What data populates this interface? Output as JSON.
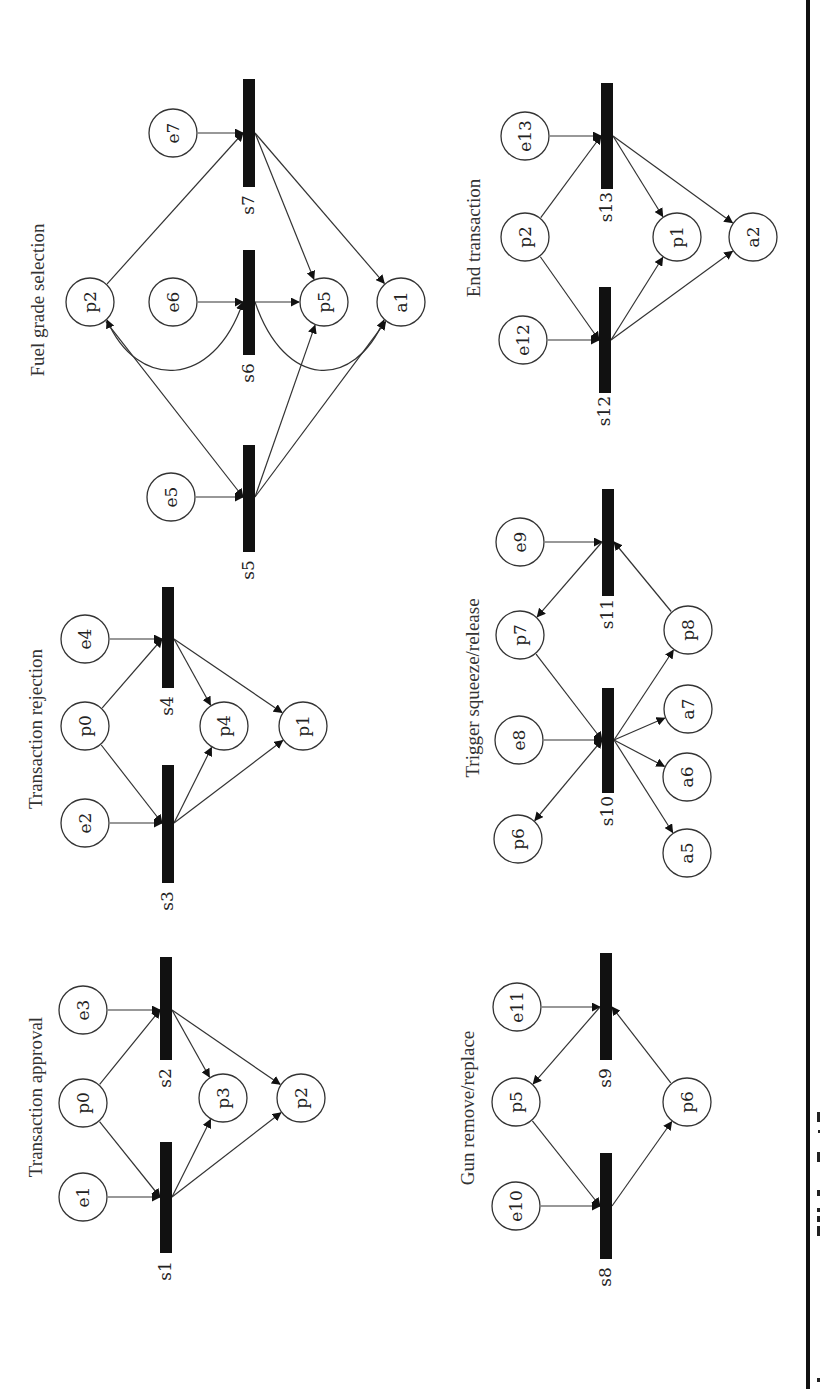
{
  "figure": {
    "orientation": "rotated 90deg (text reads bottom-to-top)",
    "panels": [
      {
        "id": "transaction-approval",
        "title": "Transaction approval",
        "title_pos": [
          38,
          1097
        ],
        "places": [
          {
            "id": "e1",
            "x": 83,
            "y": 1197
          },
          {
            "id": "p0",
            "x": 83,
            "y": 1103
          },
          {
            "id": "e3",
            "x": 83,
            "y": 1010
          },
          {
            "id": "p3",
            "x": 223,
            "y": 1098
          },
          {
            "id": "p2",
            "x": 301,
            "y": 1098
          }
        ],
        "transitions": [
          {
            "id": "s1",
            "x": 166,
            "y1": 1142,
            "y2": 1253,
            "hub": 1197
          },
          {
            "id": "s2",
            "x": 166,
            "y1": 957,
            "y2": 1060,
            "hub": 1010
          }
        ],
        "arcs": [
          {
            "from": "e1",
            "to": "s1"
          },
          {
            "from": "p0",
            "to": "s1"
          },
          {
            "from": "p0",
            "to": "s2"
          },
          {
            "from": "e3",
            "to": "s2"
          },
          {
            "from": "s1",
            "to": "p3"
          },
          {
            "from": "s1",
            "to": "p2"
          },
          {
            "from": "s2",
            "to": "p3"
          },
          {
            "from": "s2",
            "to": "p2"
          }
        ]
      },
      {
        "id": "transaction-rejection",
        "title": "Transaction rejection",
        "title_pos": [
          38,
          729
        ],
        "places": [
          {
            "id": "e2",
            "x": 85,
            "y": 823
          },
          {
            "id": "p0",
            "x": 85,
            "y": 726
          },
          {
            "id": "e4",
            "x": 85,
            "y": 639
          },
          {
            "id": "p4",
            "x": 224,
            "y": 726
          },
          {
            "id": "p1",
            "x": 303,
            "y": 726
          }
        ],
        "transitions": [
          {
            "id": "s3",
            "x": 168,
            "y1": 765,
            "y2": 883,
            "hub": 823
          },
          {
            "id": "s4",
            "x": 168,
            "y1": 587,
            "y2": 688,
            "hub": 639
          }
        ],
        "arcs": [
          {
            "from": "e2",
            "to": "s3"
          },
          {
            "from": "p0",
            "to": "s3"
          },
          {
            "from": "p0",
            "to": "s4"
          },
          {
            "from": "e4",
            "to": "s4"
          },
          {
            "from": "s3",
            "to": "p4"
          },
          {
            "from": "s3",
            "to": "p1"
          },
          {
            "from": "s4",
            "to": "p4"
          },
          {
            "from": "s4",
            "to": "p1"
          }
        ]
      },
      {
        "id": "fuel-grade-selection",
        "title": "Fuel grade selection",
        "title_pos": [
          40,
          300
        ],
        "places": [
          {
            "id": "p2",
            "x": 90,
            "y": 302
          },
          {
            "id": "e5",
            "x": 171,
            "y": 497
          },
          {
            "id": "e6",
            "x": 173,
            "y": 302
          },
          {
            "id": "e7",
            "x": 173,
            "y": 133
          },
          {
            "id": "p5",
            "x": 324,
            "y": 302
          },
          {
            "id": "a1",
            "x": 401,
            "y": 302
          }
        ],
        "transitions": [
          {
            "id": "s5",
            "x": 249,
            "y1": 445,
            "y2": 552,
            "hub": 497
          },
          {
            "id": "s6",
            "x": 249,
            "y1": 250,
            "y2": 355,
            "hub": 302
          },
          {
            "id": "s7",
            "x": 249,
            "y1": 79,
            "y2": 187,
            "hub": 133
          }
        ],
        "arcs": [
          {
            "from": "e5",
            "to": "s5"
          },
          {
            "from": "p2",
            "to": "s5"
          },
          {
            "from": "s5",
            "to": "p5"
          },
          {
            "from": "s5",
            "to": "a1"
          },
          {
            "from": "e6",
            "to": "s6"
          },
          {
            "from": "s6",
            "to": "p5"
          },
          {
            "from": "e7",
            "to": "s7"
          },
          {
            "from": "p2",
            "to": "s7"
          },
          {
            "from": "s7",
            "to": "p5"
          },
          {
            "from": "s7",
            "to": "a1"
          }
        ],
        "curved_arcs": [
          {
            "from": "p2",
            "to": "s6",
            "bidirectional": true
          },
          {
            "from": "s6",
            "to": "a1",
            "bidirectional": false
          }
        ]
      },
      {
        "id": "gun-remove-replace",
        "title": "Gun remove/replace",
        "title_pos": [
          470,
          1108
        ],
        "places": [
          {
            "id": "e10",
            "x": 516,
            "y": 1206
          },
          {
            "id": "p5",
            "x": 516,
            "y": 1102
          },
          {
            "id": "e11",
            "x": 517,
            "y": 1007
          },
          {
            "id": "p6",
            "x": 687,
            "y": 1102
          }
        ],
        "transitions": [
          {
            "id": "s8",
            "x": 606,
            "y1": 1153,
            "y2": 1259,
            "hub": 1206
          },
          {
            "id": "s9",
            "x": 606,
            "y1": 953,
            "y2": 1060,
            "hub": 1007
          }
        ],
        "arcs": [
          {
            "from": "e10",
            "to": "s8"
          },
          {
            "from": "p5",
            "to": "s8"
          },
          {
            "from": "s8",
            "to": "p6"
          },
          {
            "from": "e11",
            "to": "s9"
          },
          {
            "from": "s9",
            "to": "p5"
          },
          {
            "from": "p6",
            "to": "s9"
          }
        ]
      },
      {
        "id": "trigger-squeeze-release",
        "title": "Trigger squeeze/release",
        "title_pos": [
          475,
          688
        ],
        "places": [
          {
            "id": "p6",
            "x": 518,
            "y": 839
          },
          {
            "id": "e8",
            "x": 519,
            "y": 740
          },
          {
            "id": "p7",
            "x": 520,
            "y": 635
          },
          {
            "id": "e9",
            "x": 520,
            "y": 542
          },
          {
            "id": "a5",
            "x": 687,
            "y": 853
          },
          {
            "id": "a6",
            "x": 687,
            "y": 777
          },
          {
            "id": "a7",
            "x": 688,
            "y": 709
          },
          {
            "id": "p8",
            "x": 688,
            "y": 630
          }
        ],
        "transitions": [
          {
            "id": "s10",
            "x": 608,
            "y1": 688,
            "y2": 793,
            "hub": 740
          },
          {
            "id": "s11",
            "x": 608,
            "y1": 489,
            "y2": 596,
            "hub": 542
          }
        ],
        "arcs": [
          {
            "from": "e8",
            "to": "s10"
          },
          {
            "from": "p7",
            "to": "s10"
          },
          {
            "from": "p6",
            "to": "s10",
            "bidirectional": true
          },
          {
            "from": "s10",
            "to": "a5"
          },
          {
            "from": "s10",
            "to": "a6"
          },
          {
            "from": "s10",
            "to": "a7"
          },
          {
            "from": "s10",
            "to": "p8"
          },
          {
            "from": "e9",
            "to": "s11"
          },
          {
            "from": "s11",
            "to": "p7"
          },
          {
            "from": "p8",
            "to": "s11"
          }
        ]
      },
      {
        "id": "end-transaction",
        "title": "End transaction",
        "title_pos": [
          476,
          238
        ],
        "places": [
          {
            "id": "e12",
            "x": 523,
            "y": 340
          },
          {
            "id": "p2",
            "x": 525,
            "y": 237
          },
          {
            "id": "e13",
            "x": 525,
            "y": 136
          },
          {
            "id": "p1",
            "x": 677,
            "y": 237
          },
          {
            "id": "a2",
            "x": 753,
            "y": 237
          }
        ],
        "transitions": [
          {
            "id": "s12",
            "x": 605,
            "y1": 287,
            "y2": 393,
            "hub": 340
          },
          {
            "id": "s13",
            "x": 607,
            "y1": 83,
            "y2": 189,
            "hub": 136
          }
        ],
        "arcs": [
          {
            "from": "e12",
            "to": "s12"
          },
          {
            "from": "p2",
            "to": "s12"
          },
          {
            "from": "s12",
            "to": "p1"
          },
          {
            "from": "s12",
            "to": "a2"
          },
          {
            "from": "e13",
            "to": "s13"
          },
          {
            "from": "p2",
            "to": "s13"
          },
          {
            "from": "s13",
            "to": "p1"
          },
          {
            "from": "s13",
            "to": "a2"
          }
        ]
      }
    ]
  }
}
